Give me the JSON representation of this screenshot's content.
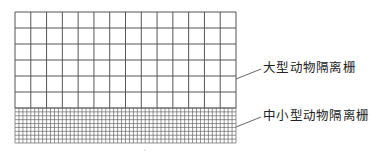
{
  "diagram": {
    "title": "",
    "colors": {
      "background": "#ffffff",
      "grid_line": "#555555",
      "fine_grid_line": "#666666",
      "text": "#222222"
    },
    "coarse_grid": {
      "name": "large-animal-fence",
      "x": 15,
      "y": 12,
      "width": 221,
      "height": 96,
      "columns": 14,
      "rows": 6
    },
    "fine_grid": {
      "name": "small-medium-animal-fence",
      "x": 15,
      "y": 108,
      "width": 221,
      "height": 35,
      "columns": 56,
      "rows": 9
    },
    "labels": [
      {
        "id": "large",
        "text": "大型动物隔离栅",
        "x": 263,
        "y": 62,
        "leader": {
          "x1": 236,
          "y1": 79,
          "x2": 261,
          "y2": 69
        }
      },
      {
        "id": "small-medium",
        "text": "中小型动物隔离栅",
        "x": 263,
        "y": 110,
        "leader": {
          "x1": 236,
          "y1": 127,
          "x2": 261,
          "y2": 117
        }
      }
    ]
  }
}
